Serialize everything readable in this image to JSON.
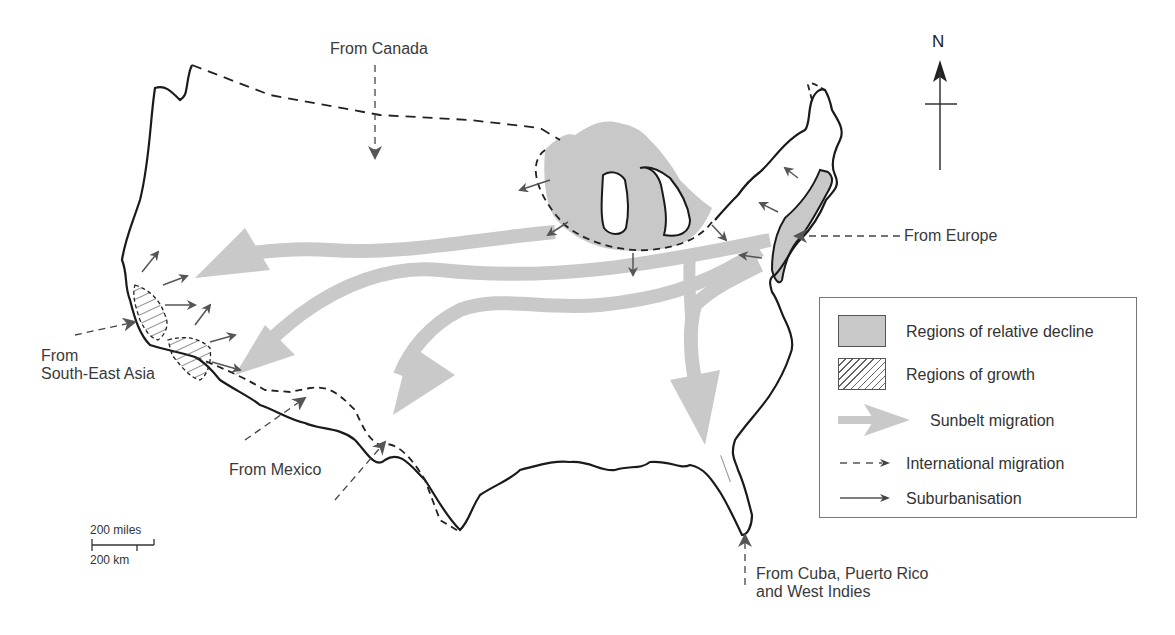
{
  "map": {
    "title": "",
    "labels": {
      "canada": "From Canada",
      "europe": "From Europe",
      "se_asia_line1": "From",
      "se_asia_line2": "South-East Asia",
      "mexico": "From Mexico",
      "caribbean_line1": "From Cuba, Puerto Rico",
      "caribbean_line2": "and West Indies"
    },
    "colors": {
      "decline_fill": "#c8c8c8",
      "sunbelt_arrow": "#c9c9c9",
      "small_arrow": "#555555",
      "outline": "#1a1a1a"
    }
  },
  "legend": {
    "items": [
      {
        "type": "decline-swatch",
        "label": "Regions of relative decline"
      },
      {
        "type": "growth-swatch",
        "label": "Regions of growth"
      },
      {
        "type": "sunbelt-arrow",
        "label": "Sunbelt migration"
      },
      {
        "type": "international-arrow",
        "label": "International migration"
      },
      {
        "type": "suburbanisation-arrow",
        "label": "Suburbanisation"
      }
    ]
  },
  "scale_bar": {
    "miles_label": "200 miles",
    "km_label": "200 km"
  },
  "north_arrow": {
    "label": "N"
  }
}
